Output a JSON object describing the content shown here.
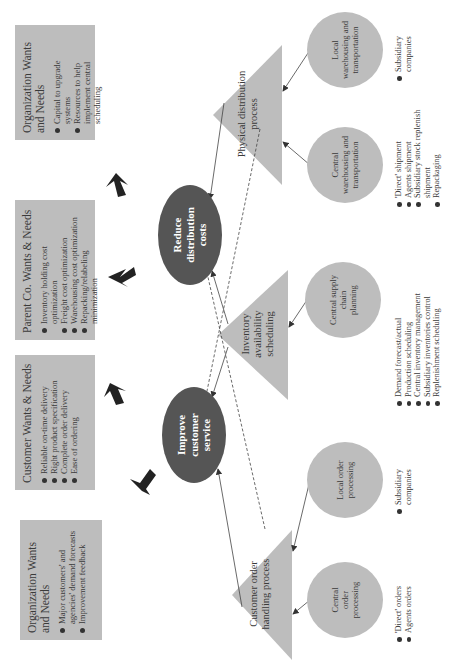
{
  "goals": {
    "improve_customer_service": "Improve customer service",
    "reduce_distribution_costs": "Reduce distribution costs"
  },
  "wants_boxes": [
    {
      "title": "Organization Wants and Needs",
      "items": [
        "Major customers' and agencies' demand forecasts",
        "Improvement feedback"
      ]
    },
    {
      "title": "Customer Wants & Needs",
      "items": [
        "Reliable on-time delivery",
        "Right product specification",
        "Complete order delivery",
        "Ease of ordering"
      ]
    },
    {
      "title": "Parent Co. Wants & Needs",
      "items": [
        "Inventory holding cost optimization",
        "Freight cost optimization",
        "Warehousing cost optimization",
        "Repacking/relabeling minimization"
      ]
    },
    {
      "title": "Organization Wants and Needs",
      "items": [
        "Capital to upgrade systems",
        "Resources to help implement central scheduling"
      ]
    }
  ],
  "processes": [
    {
      "label": "Customer order handling process"
    },
    {
      "label": "Inventory availability scheduling"
    },
    {
      "label": "Physical distribution process"
    }
  ],
  "subprocesses": [
    {
      "label": "Central order processing",
      "items": [
        "'Direct' orders",
        "Agents orders"
      ]
    },
    {
      "label": "Local order processing",
      "items": [
        "Subsidiary companies"
      ]
    },
    {
      "label": "Central supply chain planning",
      "items": [
        "Demand forecast/actual",
        "Production scheduling",
        "Central inventory management",
        "Subsidiary inventories control",
        "Replenishment scheduling"
      ]
    },
    {
      "label": "Central warehousing and transportation",
      "items": [
        "'Direct' shipment",
        "Agents shipment",
        "Subsidiary stock replenish shipment",
        "Repackaging"
      ]
    },
    {
      "label": "Local warehousing and transportation",
      "items": [
        "Subsidiary companies"
      ]
    }
  ],
  "colors": {
    "box_fill": "#bdbdbd",
    "goal_fill": "#555555",
    "arrow": "#222222"
  }
}
